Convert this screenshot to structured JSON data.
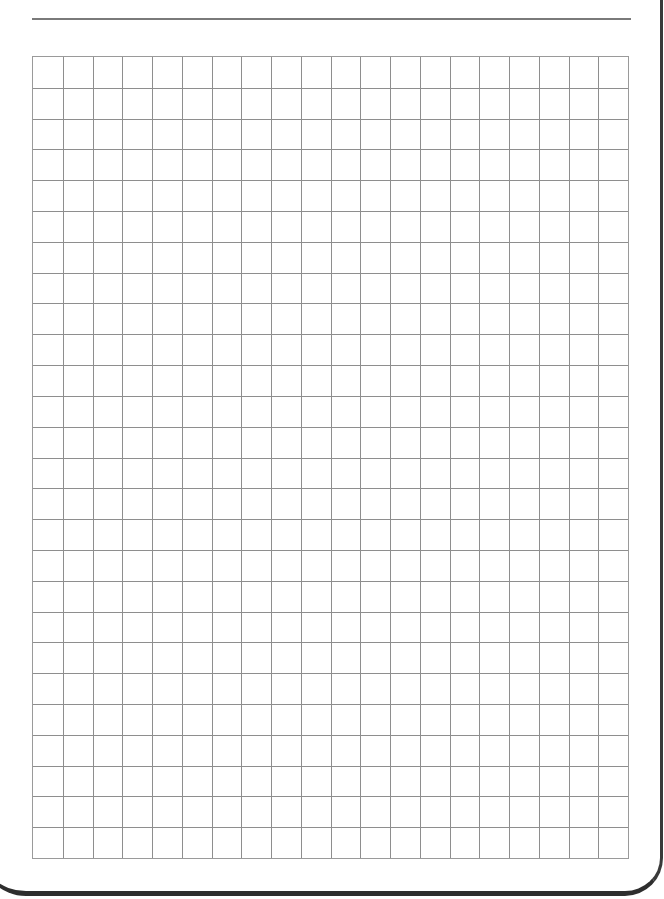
{
  "document": {
    "type": "graph-paper",
    "top_rule": true,
    "grid": {
      "columns": 20,
      "rows": 26,
      "line_color": "#8e8e8e",
      "border_color": "#9a9a9a",
      "background": "#ffffff"
    },
    "page_edge_color": "#2e2e2e"
  }
}
